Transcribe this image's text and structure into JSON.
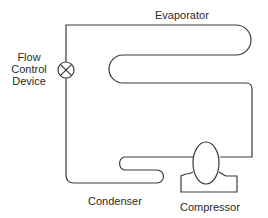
{
  "diagram": {
    "labels": {
      "evaporator": "Evaporator",
      "flow_line1": "Flow",
      "flow_line2": "Control",
      "flow_line3": "Device",
      "condenser": "Condenser",
      "compressor": "Compressor"
    },
    "components": [
      {
        "id": "evaporator",
        "type": "serpentine-coil"
      },
      {
        "id": "flow-control-device",
        "type": "valve-symbol"
      },
      {
        "id": "condenser",
        "type": "serpentine-coil"
      },
      {
        "id": "compressor",
        "type": "compressor-symbol"
      }
    ],
    "colors": {
      "stroke": "#3a3a3a",
      "text": "#2a2a2a",
      "background": "#ffffff"
    }
  }
}
